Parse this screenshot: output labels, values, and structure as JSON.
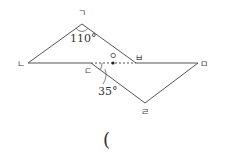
{
  "diagram": {
    "points": {
      "giyeok": {
        "label": "ㄱ",
        "x": 82,
        "y": 24
      },
      "nieun": {
        "label": "ㄴ",
        "x": 28,
        "y": 63
      },
      "digeut": {
        "label": "ㄷ",
        "x": 91,
        "y": 63
      },
      "ieung": {
        "label": "ㅇ",
        "x": 113,
        "y": 63
      },
      "bieup": {
        "label": "ㅂ",
        "x": 136,
        "y": 63
      },
      "mieum": {
        "label": "ㅁ",
        "x": 198,
        "y": 63
      },
      "rieul": {
        "label": "ㄹ",
        "x": 145,
        "y": 103
      }
    },
    "angles": {
      "top": "110°",
      "bottom": "35°"
    },
    "answer_paren": "("
  },
  "colors": {
    "line": "#555555",
    "text": "#333333"
  }
}
